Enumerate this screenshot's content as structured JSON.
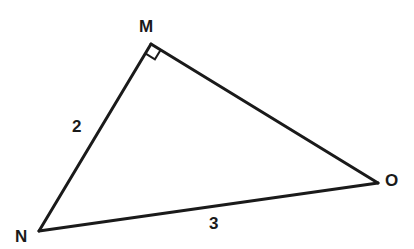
{
  "diagram": {
    "type": "right-triangle",
    "stroke_color": "#1a1a1a",
    "vertices": [
      {
        "label": "M",
        "x": 151,
        "y": 44,
        "label_x": 139,
        "label_y": 32
      },
      {
        "label": "N",
        "x": 39,
        "y": 231,
        "label_x": 15,
        "label_y": 242
      },
      {
        "label": "O",
        "x": 378,
        "y": 183,
        "label_x": 385,
        "label_y": 186
      }
    ],
    "sides": [
      {
        "from": "M",
        "to": "N",
        "length_label": "2",
        "label_x": 70,
        "label_y": 130
      },
      {
        "from": "N",
        "to": "O",
        "length_label": "3",
        "label_x": 209,
        "label_y": 227
      },
      {
        "from": "M",
        "to": "O",
        "length_label": ""
      }
    ],
    "right_angle_at": "M"
  }
}
